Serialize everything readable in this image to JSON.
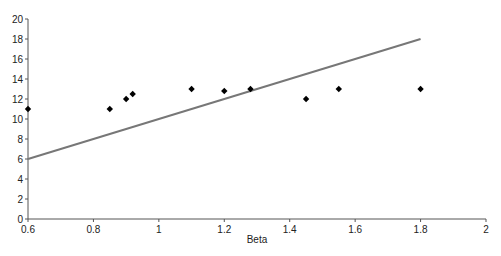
{
  "chart_data": {
    "type": "scatter",
    "title": "",
    "xlabel": "Beta",
    "ylabel": "",
    "xlim": [
      0.6,
      2
    ],
    "ylim": [
      0,
      20
    ],
    "x_ticks": [
      "0.6",
      "0.8",
      "1",
      "1.2",
      "1.4",
      "1.6",
      "1.8",
      "2"
    ],
    "y_ticks": [
      "0",
      "2",
      "4",
      "6",
      "8",
      "10",
      "12",
      "14",
      "16",
      "18",
      "20"
    ],
    "grid": false,
    "legend": null,
    "series": [
      {
        "name": "observed",
        "type": "scatter",
        "marker": "diamond",
        "color": "#000000",
        "points": [
          {
            "x": 0.6,
            "y": 11
          },
          {
            "x": 0.85,
            "y": 11
          },
          {
            "x": 0.9,
            "y": 12
          },
          {
            "x": 0.92,
            "y": 12.5
          },
          {
            "x": 1.1,
            "y": 13
          },
          {
            "x": 1.2,
            "y": 12.8
          },
          {
            "x": 1.28,
            "y": 13
          },
          {
            "x": 1.45,
            "y": 12
          },
          {
            "x": 1.55,
            "y": 13
          },
          {
            "x": 1.8,
            "y": 13
          }
        ]
      },
      {
        "name": "line",
        "type": "line",
        "color": "#777777",
        "points": [
          {
            "x": 0.6,
            "y": 6
          },
          {
            "x": 1.8,
            "y": 18
          }
        ]
      }
    ]
  }
}
